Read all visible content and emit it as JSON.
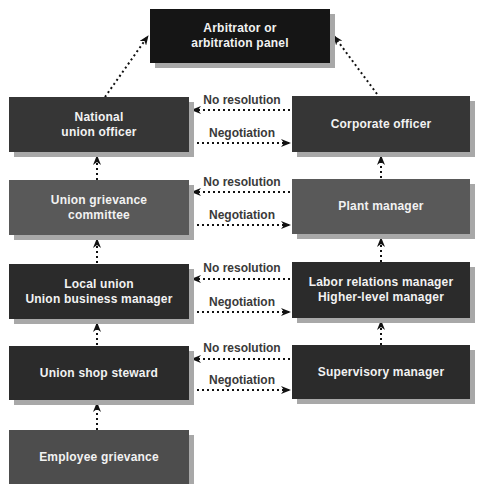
{
  "diagram": {
    "top": {
      "line1": "Arbitrator or",
      "line2": "arbitration panel",
      "color": "#151515"
    },
    "union_side": [
      {
        "line1": "National",
        "line2": "union officer",
        "color": "#363636"
      },
      {
        "line1": "Union grievance",
        "line2": "committee",
        "color": "#595959"
      },
      {
        "line1": "Local union",
        "line2": "Union business manager",
        "color": "#2b2b2b"
      },
      {
        "line1": "Union shop steward",
        "line2": "",
        "color": "#2b2b2b"
      },
      {
        "line1": "Employee grievance",
        "line2": "",
        "color": "#4d4d4d"
      }
    ],
    "management_side": [
      {
        "line1": "Corporate officer",
        "line2": "",
        "color": "#363636"
      },
      {
        "line1": "Plant manager",
        "line2": "",
        "color": "#595959"
      },
      {
        "line1": "Labor relations manager",
        "line2": "Higher-level manager",
        "color": "#2b2b2b"
      },
      {
        "line1": "Supervisory manager",
        "line2": "",
        "color": "#2b2b2b"
      }
    ],
    "edge_labels": {
      "no_resolution": "No resolution",
      "negotiation": "Negotiation"
    }
  }
}
